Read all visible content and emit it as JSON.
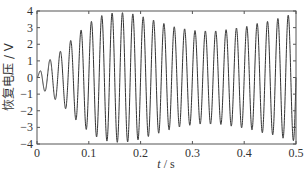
{
  "chart_data": {
    "type": "line",
    "title": "",
    "xlabel": "t / s",
    "xlabel_var": "t",
    "xlabel_unit": " / s",
    "ylabel": "恢复电压 / V",
    "xlim": [
      0,
      0.5
    ],
    "ylim": [
      -4,
      4
    ],
    "xticks": [
      0,
      0.1,
      0.2,
      0.3,
      0.4,
      0.5
    ],
    "xtick_labels": [
      "0",
      "0.1",
      "0.2",
      "0.3",
      "0.4",
      "0.5"
    ],
    "yticks": [
      -4,
      -3,
      -2,
      -1,
      0,
      1,
      2,
      3,
      4
    ],
    "ytick_labels": [
      "-4",
      "-3",
      "-2",
      "-1",
      "0",
      "1",
      "2",
      "3",
      "4"
    ],
    "grid": false,
    "legend": null,
    "series": [
      {
        "name": "recovery voltage",
        "color": "#333333",
        "frequency_hz": 50,
        "description": "Sinusoidal oscillation ~50 Hz with amplitude envelope rising from 0 to ~3.9 V near t=0.15 s, decaying to ~2.8 V near t=0.3 s, then rising again to ~3.8 V at t=0.5 s",
        "envelope": {
          "t": [
            0,
            0.01,
            0.03,
            0.05,
            0.07,
            0.09,
            0.11,
            0.13,
            0.15,
            0.17,
            0.19,
            0.21,
            0.23,
            0.25,
            0.27,
            0.29,
            0.31,
            0.33,
            0.35,
            0.37,
            0.39,
            0.41,
            0.43,
            0.45,
            0.47,
            0.49,
            0.5
          ],
          "amplitude": [
            0.0,
            0.7,
            1.2,
            1.7,
            2.4,
            3.0,
            3.5,
            3.8,
            3.9,
            3.9,
            3.8,
            3.6,
            3.4,
            3.2,
            3.0,
            2.9,
            2.8,
            2.8,
            2.8,
            2.9,
            3.0,
            3.1,
            3.3,
            3.4,
            3.6,
            3.8,
            3.8
          ]
        }
      }
    ]
  }
}
